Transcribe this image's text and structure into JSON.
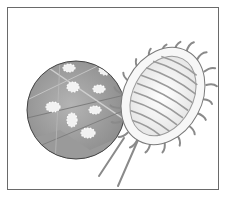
{
  "illustration": {
    "subject": "mealybug",
    "inset": "magnified leaf with mealybugs",
    "colors": {
      "frame": "#6a6a6a",
      "leaf_dark": "#8a8a8a",
      "leaf_mid": "#a9a9a9",
      "bug_white": "#f4f4f4",
      "stripe": "#9a9a9a",
      "outline": "#555555"
    }
  }
}
